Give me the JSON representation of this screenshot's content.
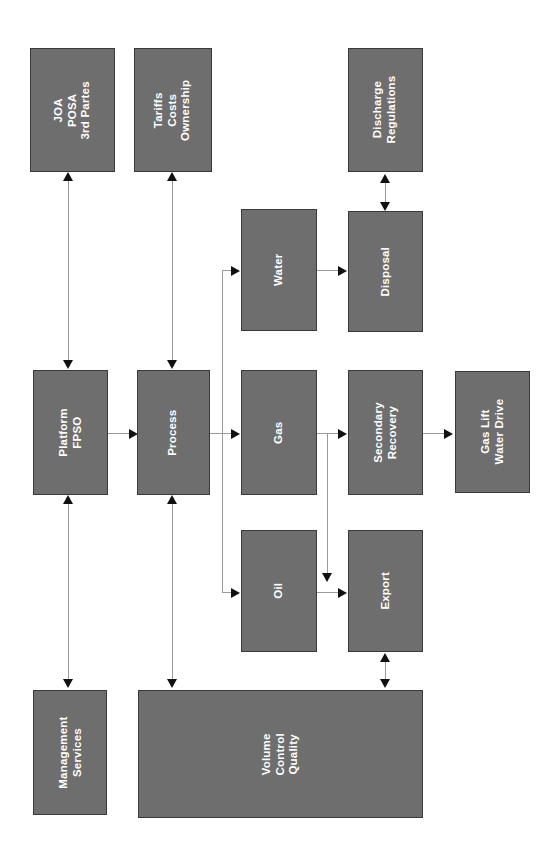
{
  "diagram": {
    "title": "",
    "orientation": "rotated-90-ccw",
    "palette": {
      "node_fill": "#6e6e6e",
      "node_border": "#3a3a3a",
      "node_text": "#ffffff",
      "connector": "#9a9a9a",
      "arrowhead": "#111111",
      "background": "#ffffff"
    },
    "nodes": [
      {
        "id": "joa",
        "line1": "JOA",
        "line2": "POSA",
        "line3": "3rd Partes"
      },
      {
        "id": "tariffs",
        "line1": "Tariffs",
        "line2": "Costs",
        "line3": "Ownership"
      },
      {
        "id": "discharge",
        "line1": "Discharge",
        "line2": "Regulations",
        "line3": ""
      },
      {
        "id": "water",
        "line1": "Water",
        "line2": "",
        "line3": ""
      },
      {
        "id": "disposal",
        "line1": "Disposal",
        "line2": "",
        "line3": ""
      },
      {
        "id": "platform",
        "line1": "Platform",
        "line2": "FPSO",
        "line3": ""
      },
      {
        "id": "process",
        "line1": "Process",
        "line2": "",
        "line3": ""
      },
      {
        "id": "gas",
        "line1": "Gas",
        "line2": "",
        "line3": ""
      },
      {
        "id": "secondary",
        "line1": "Secondary",
        "line2": "Recovery",
        "line3": ""
      },
      {
        "id": "gaslift",
        "line1": "Gas Lift",
        "line2": "Water Drive",
        "line3": ""
      },
      {
        "id": "oil",
        "line1": "Oil",
        "line2": "",
        "line3": ""
      },
      {
        "id": "export",
        "line1": "Export",
        "line2": "",
        "line3": ""
      },
      {
        "id": "management",
        "line1": "Management",
        "line2": "Services",
        "line3": ""
      },
      {
        "id": "vcq",
        "line1": "Volume",
        "line2": "Control",
        "line3": "Quality"
      }
    ],
    "edges": [
      {
        "from": "platform",
        "to": "joa",
        "type": "bidirectional"
      },
      {
        "from": "process",
        "to": "tariffs",
        "type": "bidirectional"
      },
      {
        "from": "disposal",
        "to": "discharge",
        "type": "bidirectional"
      },
      {
        "from": "water",
        "to": "disposal",
        "type": "directed"
      },
      {
        "from": "platform",
        "to": "process",
        "type": "directed"
      },
      {
        "from": "process",
        "to": "water",
        "type": "directed"
      },
      {
        "from": "process",
        "to": "gas",
        "type": "directed"
      },
      {
        "from": "process",
        "to": "oil",
        "type": "directed"
      },
      {
        "from": "gas",
        "to": "secondary",
        "type": "directed"
      },
      {
        "from": "gas",
        "to": "export",
        "type": "directed"
      },
      {
        "from": "oil",
        "to": "export",
        "type": "directed"
      },
      {
        "from": "secondary",
        "to": "gaslift",
        "type": "directed"
      },
      {
        "from": "platform",
        "to": "management",
        "type": "bidirectional"
      },
      {
        "from": "process",
        "to": "vcq",
        "type": "bidirectional"
      },
      {
        "from": "export",
        "to": "vcq",
        "type": "bidirectional"
      }
    ]
  }
}
